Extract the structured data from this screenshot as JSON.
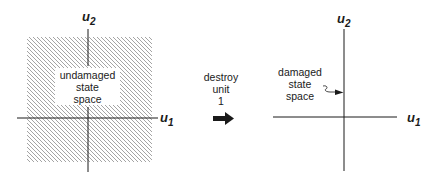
{
  "left_panel": {
    "axis_x_label": "u",
    "axis_x_sub": "1",
    "axis_y_label": "u",
    "axis_y_sub": "2",
    "region_lines": [
      "undamaged",
      "state",
      "space"
    ]
  },
  "transition": {
    "lines": [
      "destroy",
      "unit",
      "1"
    ],
    "arrow": "right-arrow"
  },
  "right_panel": {
    "axis_x_label": "u",
    "axis_x_sub": "1",
    "axis_y_label": "u",
    "axis_y_sub": "2",
    "region_lines": [
      "damaged",
      "state",
      "space"
    ]
  },
  "colors": {
    "ink": "#1a1a1a",
    "hatch": "#9a9a9a",
    "background": "#ffffff"
  }
}
